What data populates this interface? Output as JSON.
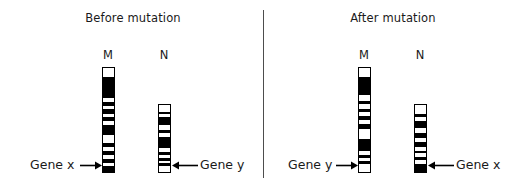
{
  "figure": {
    "width": 528,
    "height": 189,
    "background": "#ffffff",
    "band_dark_color": "#000000",
    "band_light_color": "#ffffff",
    "outline_color": "#000000",
    "divider_color": "#4d4d4d",
    "text_color": "#1a1a1a"
  },
  "panels": [
    {
      "id": "before",
      "title": "Before mutation",
      "chromosomes": [
        {
          "id": "before-m",
          "label": "M",
          "x": 102,
          "y": 67,
          "width": 13,
          "height": 106,
          "bands": [
            {
              "color": "#ffffff",
              "h": 9
            },
            {
              "color": "#000000",
              "h": 3
            },
            {
              "color": "#000000",
              "h": 19
            },
            {
              "color": "#ffffff",
              "h": 4
            },
            {
              "color": "#000000",
              "h": 4
            },
            {
              "color": "#ffffff",
              "h": 3
            },
            {
              "color": "#000000",
              "h": 5
            },
            {
              "color": "#ffffff",
              "h": 3
            },
            {
              "color": "#000000",
              "h": 4
            },
            {
              "color": "#ffffff",
              "h": 4
            },
            {
              "color": "#000000",
              "h": 10
            },
            {
              "color": "#ffffff",
              "h": 8
            },
            {
              "color": "#000000",
              "h": 5
            },
            {
              "color": "#ffffff",
              "h": 4
            },
            {
              "color": "#000000",
              "h": 4
            },
            {
              "color": "#ffffff",
              "h": 4
            },
            {
              "color": "#000000",
              "h": 4
            },
            {
              "color": "#ffffff",
              "h": 3
            },
            {
              "color": "#000000",
              "h": 6
            }
          ]
        },
        {
          "id": "before-n",
          "label": "N",
          "x": 158,
          "y": 104,
          "width": 13,
          "height": 69,
          "bands": [
            {
              "color": "#ffffff",
              "h": 7
            },
            {
              "color": "#000000",
              "h": 3
            },
            {
              "color": "#ffffff",
              "h": 3
            },
            {
              "color": "#000000",
              "h": 8
            },
            {
              "color": "#ffffff",
              "h": 5
            },
            {
              "color": "#000000",
              "h": 4
            },
            {
              "color": "#ffffff",
              "h": 4
            },
            {
              "color": "#000000",
              "h": 12
            },
            {
              "color": "#ffffff",
              "h": 4
            },
            {
              "color": "#000000",
              "h": 3
            },
            {
              "color": "#ffffff",
              "h": 3
            },
            {
              "color": "#000000",
              "h": 3
            },
            {
              "color": "#ffffff",
              "h": 3
            },
            {
              "color": "#000000",
              "h": 3
            },
            {
              "color": "#ffffff",
              "h": 6
            }
          ]
        }
      ],
      "annotations": [
        {
          "id": "before-gene-x",
          "text": "Gene x",
          "label_x": 30,
          "label_y": 157,
          "arrow_x": 80,
          "arrow_y": 165,
          "arrow_len": 22,
          "direction": "right"
        },
        {
          "id": "before-gene-y",
          "text": "Gene y",
          "label_x": 200,
          "label_y": 157,
          "arrow_x": 172,
          "arrow_y": 165,
          "arrow_len": 26,
          "direction": "left"
        }
      ]
    },
    {
      "id": "after",
      "title": "After mutation",
      "chromosomes": [
        {
          "id": "after-m",
          "label": "M",
          "x": 358,
          "y": 67,
          "width": 13,
          "height": 106,
          "bands": [
            {
              "color": "#ffffff",
              "h": 9
            },
            {
              "color": "#000000",
              "h": 3
            },
            {
              "color": "#000000",
              "h": 16
            },
            {
              "color": "#ffffff",
              "h": 6
            },
            {
              "color": "#000000",
              "h": 3
            },
            {
              "color": "#ffffff",
              "h": 5
            },
            {
              "color": "#000000",
              "h": 3
            },
            {
              "color": "#ffffff",
              "h": 4
            },
            {
              "color": "#000000",
              "h": 4
            },
            {
              "color": "#ffffff",
              "h": 4
            },
            {
              "color": "#000000",
              "h": 5
            },
            {
              "color": "#ffffff",
              "h": 10
            },
            {
              "color": "#000000",
              "h": 13
            },
            {
              "color": "#ffffff",
              "h": 4
            },
            {
              "color": "#000000",
              "h": 3
            },
            {
              "color": "#ffffff",
              "h": 3
            },
            {
              "color": "#000000",
              "h": 3
            },
            {
              "color": "#ffffff",
              "h": 8
            }
          ]
        },
        {
          "id": "after-n",
          "label": "N",
          "x": 414,
          "y": 104,
          "width": 13,
          "height": 69,
          "bands": [
            {
              "color": "#ffffff",
              "h": 9
            },
            {
              "color": "#000000",
              "h": 3
            },
            {
              "color": "#ffffff",
              "h": 4
            },
            {
              "color": "#000000",
              "h": 8
            },
            {
              "color": "#ffffff",
              "h": 5
            },
            {
              "color": "#000000",
              "h": 5
            },
            {
              "color": "#ffffff",
              "h": 4
            },
            {
              "color": "#000000",
              "h": 5
            },
            {
              "color": "#ffffff",
              "h": 4
            },
            {
              "color": "#000000",
              "h": 3
            },
            {
              "color": "#ffffff",
              "h": 4
            },
            {
              "color": "#000000",
              "h": 3
            },
            {
              "color": "#ffffff",
              "h": 4
            },
            {
              "color": "#000000",
              "h": 8
            }
          ]
        }
      ],
      "annotations": [
        {
          "id": "after-gene-y",
          "text": "Gene y",
          "label_x": 288,
          "label_y": 157,
          "arrow_x": 336,
          "arrow_y": 165,
          "arrow_len": 22,
          "direction": "right"
        },
        {
          "id": "after-gene-x",
          "text": "Gene x",
          "label_x": 456,
          "label_y": 157,
          "arrow_x": 428,
          "arrow_y": 165,
          "arrow_len": 26,
          "direction": "left"
        }
      ]
    }
  ],
  "divider": {
    "x": 263,
    "y": 10,
    "height": 168
  },
  "title_positions": {
    "before": {
      "x": 68,
      "y": 11,
      "width": 130
    },
    "after": {
      "x": 328,
      "y": 11,
      "width": 130
    }
  },
  "label_positions": {
    "before_m": {
      "x": 98,
      "y": 48
    },
    "before_n": {
      "x": 154,
      "y": 48
    },
    "after_m": {
      "x": 354,
      "y": 48
    },
    "after_n": {
      "x": 410,
      "y": 48
    }
  }
}
